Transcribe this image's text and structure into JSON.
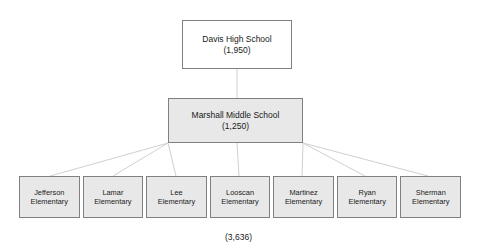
{
  "diagram": {
    "type": "organizational-hierarchy",
    "title_present": false,
    "background_color": "#ffffff",
    "box_border_color": "#808080",
    "box_fill_white": "#ffffff",
    "box_fill_gray": "#e8e8e8",
    "connector_color": "#d0d0d0",
    "levels": {
      "level1": {
        "name": "Davis High School",
        "count": "(1,950)",
        "fill": "white"
      },
      "level2": {
        "name": "Marshall Middle School",
        "count": "(1,250)",
        "fill": "gray"
      },
      "level3": {
        "fill": "gray",
        "nodes": [
          {
            "line1": "Jefferson",
            "line2": "Elementary"
          },
          {
            "line1": "Lamar",
            "line2": "Elementary"
          },
          {
            "line1": "Lee",
            "line2": "Elementary"
          },
          {
            "line1": "Looscan",
            "line2": "Elementary"
          },
          {
            "line1": "Martinez",
            "line2": "Elementary"
          },
          {
            "line1": "Ryan",
            "line2": "Elementary"
          },
          {
            "line1": "Sherman",
            "line2": "Elementary"
          }
        ]
      }
    },
    "footer": {
      "total": "(3,636)"
    }
  }
}
